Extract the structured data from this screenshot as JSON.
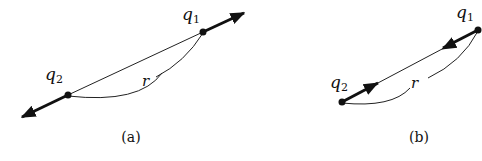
{
  "figures": [
    {
      "id": "a",
      "caption": "(a)",
      "charges": [
        {
          "name": "q",
          "subscript": "1"
        },
        {
          "name": "q",
          "subscript": "2"
        }
      ],
      "distance_label": "r",
      "force_direction": "repulsive (outward)"
    },
    {
      "id": "b",
      "caption": "(b)",
      "charges": [
        {
          "name": "q",
          "subscript": "1"
        },
        {
          "name": "q",
          "subscript": "2"
        }
      ],
      "distance_label": "r",
      "force_direction": "attractive (inward)"
    }
  ],
  "colors": {
    "ink": "#111111",
    "background": "#ffffff"
  }
}
